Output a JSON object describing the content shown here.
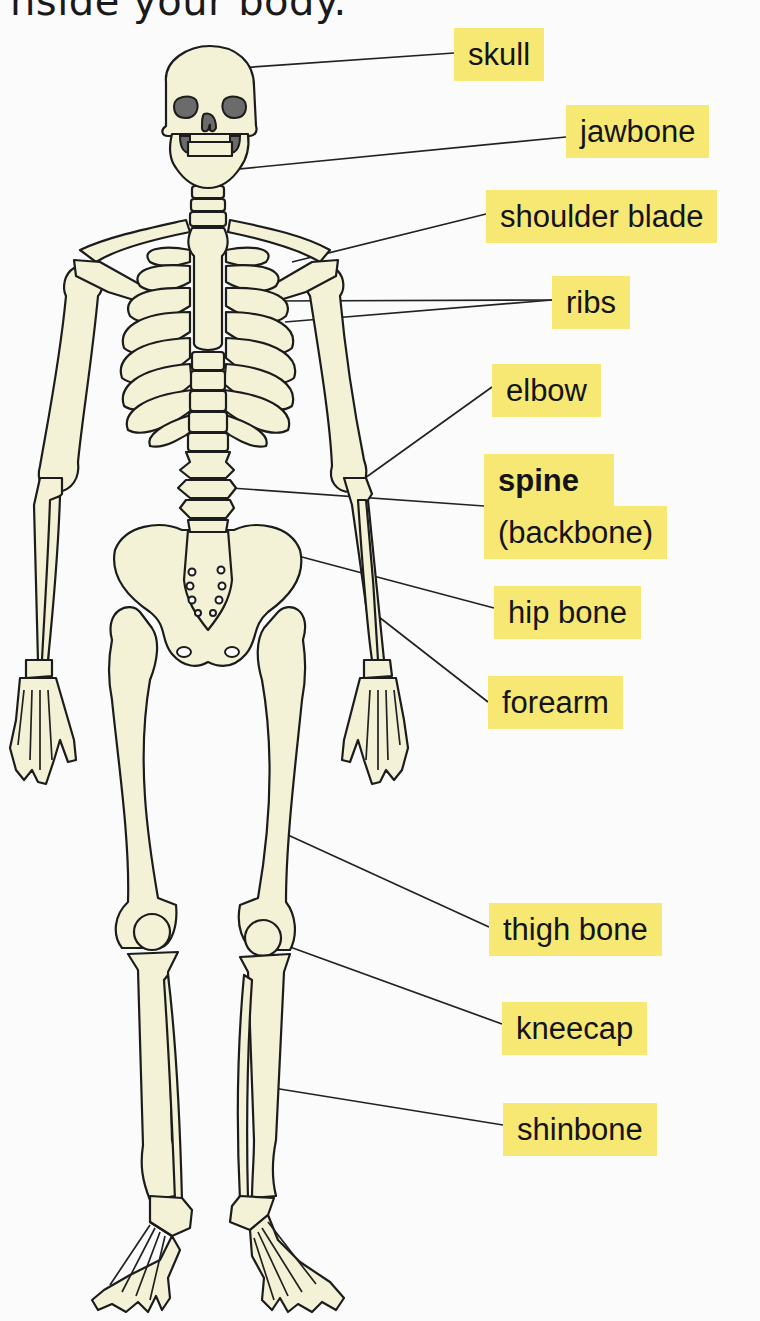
{
  "heading": {
    "text": "nside your body."
  },
  "colors": {
    "label_background": "#f6e873",
    "bone_fill": "#f3f2d6",
    "outline": "#1c1c1c",
    "eye_socket": "#6b6b6b"
  },
  "labels": [
    {
      "id": "skull",
      "text": "skull",
      "bold": false
    },
    {
      "id": "jawbone",
      "text": "jawbone",
      "bold": false
    },
    {
      "id": "shoulder_blade",
      "text": "shoulder blade",
      "bold": false
    },
    {
      "id": "ribs",
      "text": "ribs",
      "bold": false
    },
    {
      "id": "elbow",
      "text": "elbow",
      "bold": false
    },
    {
      "id": "spine",
      "text": "spine",
      "bold": true
    },
    {
      "id": "backbone",
      "text": "(backbone)",
      "bold": false
    },
    {
      "id": "hip_bone",
      "text": "hip bone",
      "bold": false
    },
    {
      "id": "forearm",
      "text": "forearm",
      "bold": false
    },
    {
      "id": "thigh_bone",
      "text": "thigh bone",
      "bold": false
    },
    {
      "id": "kneecap",
      "text": "kneecap",
      "bold": false
    },
    {
      "id": "shinbone",
      "text": "shinbone",
      "bold": false
    }
  ],
  "diagram": {
    "icon": "skeleton-illustration"
  }
}
